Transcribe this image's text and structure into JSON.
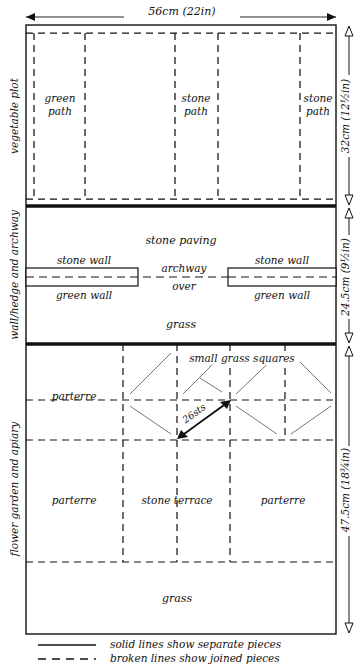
{
  "diagram": {
    "title_fragment": "",
    "dimensions": {
      "width_top": "56cm (22in)",
      "vegetable_plot_height": "32cm (12½in)",
      "wall_band_height": "24.5cm (9½in)",
      "flower_garden_height": "47.5cm (18¾in)",
      "diagonal": "26sts"
    },
    "section_labels": [
      {
        "name": "vegetable-plot",
        "text": "vegetable plot"
      },
      {
        "name": "wall-hedge-archway",
        "text": "wall/hedge and archway"
      },
      {
        "name": "flower-garden-apiary",
        "text": "flower garden and apiary"
      }
    ],
    "vegetable_plot": {
      "cells": [
        {
          "name": "green-path",
          "line1": "green",
          "line2": "path"
        },
        {
          "name": "stone-path-center",
          "line1": "stone",
          "line2": "path"
        },
        {
          "name": "stone-path-right",
          "line1": "stone",
          "line2": "path"
        }
      ]
    },
    "wall_band": {
      "stone_paving": "stone paving",
      "archway_line1": "archway",
      "archway_line2": "over",
      "stone_wall_left": "stone wall",
      "green_wall_left": "green wall",
      "stone_wall_right": "stone wall",
      "green_wall_right": "green wall",
      "grass": "grass"
    },
    "flower_garden": {
      "small_grass_squares": "small grass squares",
      "parterre_top": "parterre",
      "parterre_left": "parterre",
      "stone_terrace": "stone terrace",
      "parterre_right": "parterre",
      "grass": "grass"
    },
    "legend": [
      {
        "name": "legend-solid",
        "style": "solid",
        "text": "solid lines show separate pieces"
      },
      {
        "name": "legend-broken",
        "style": "broken",
        "text": "broken lines show joined pieces"
      }
    ],
    "colors": {
      "ink": "#111111",
      "paper": "#ffffff",
      "thin": "#222222",
      "hairline": "#555555"
    }
  }
}
